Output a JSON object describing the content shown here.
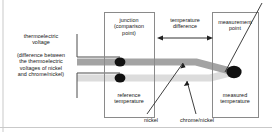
{
  "diagram": {
    "background_color": "#ffffff",
    "labels": {
      "thermoelectric_voltage": "thermoelectric\nvoltage",
      "thermoelectric_difference": "(difference between\nthe thermoelectric\nvoltages of nickel\nand chrome/nickel)",
      "junction": "junction\n(comparison\npoint)",
      "reference_temperature": "reference\ntemperature",
      "temperature_difference": "temperature\ndifference",
      "measurement_point": "measurement\npoint",
      "measured_temperature": "measured\ntemperature",
      "nickel": "nickel",
      "chrome_nickel": "chrome/nickel"
    },
    "colors": {
      "text": "#141414",
      "line": "#4d4d4d",
      "box_border": "#8a8a8a",
      "node_dot": "#111111",
      "wire_nickel": "#a3a3a3",
      "wire_chrome_nickel": "#dcdcdc",
      "frame": "#c9c9c9"
    },
    "boxes": [
      {
        "name": "junction-box",
        "x": 104,
        "y": 12,
        "w": 50,
        "h": 106
      },
      {
        "name": "measurement-box",
        "x": 212,
        "y": 12,
        "w": 47,
        "h": 106
      }
    ],
    "nodes": [
      {
        "name": "junction-nickel-node",
        "cx": 120,
        "cy": 62,
        "r": 5.2
      },
      {
        "name": "junction-chrome-node",
        "cx": 120,
        "cy": 78,
        "r": 5.2
      },
      {
        "name": "measurement-node",
        "cx": 234,
        "cy": 72,
        "r": 7.2
      }
    ],
    "arrow": {
      "name": "temperature-difference-arrow",
      "x1": 158,
      "x2": 212,
      "y": 38
    }
  }
}
